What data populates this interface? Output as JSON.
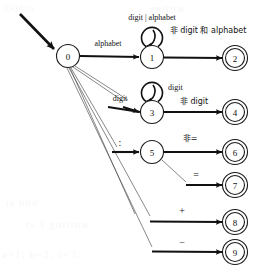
{
  "diagram": {
    "kind": "state-transition-diagram",
    "colors": {
      "stroke": "#111111",
      "thin_stroke": "#555555",
      "background": "#ffffff"
    },
    "start": {
      "label": "",
      "target_state": "0"
    },
    "states": [
      {
        "id": "s0",
        "label": "0",
        "cx": 68,
        "cy": 56,
        "r": 11.5,
        "accepting": false
      },
      {
        "id": "s1",
        "label": "1",
        "cx": 152,
        "cy": 57,
        "r": 11.5,
        "accepting": false
      },
      {
        "id": "s2",
        "label": "2",
        "cx": 235,
        "cy": 58,
        "r": 9.5,
        "accepting": true
      },
      {
        "id": "s3",
        "label": "3",
        "cx": 152,
        "cy": 112,
        "r": 11.5,
        "accepting": false
      },
      {
        "id": "s4",
        "label": "4",
        "cx": 235,
        "cy": 112,
        "r": 9.5,
        "accepting": true
      },
      {
        "id": "s5",
        "label": "5",
        "cx": 152,
        "cy": 152,
        "r": 11.5,
        "accepting": false
      },
      {
        "id": "s6",
        "label": "6",
        "cx": 235,
        "cy": 152,
        "r": 9.5,
        "accepting": true
      },
      {
        "id": "s7",
        "label": "7",
        "cx": 235,
        "cy": 185,
        "r": 9.5,
        "accepting": true
      },
      {
        "id": "s8",
        "label": "8",
        "cx": 235,
        "cy": 222,
        "r": 9.5,
        "accepting": true
      },
      {
        "id": "s9",
        "label": "9",
        "cx": 235,
        "cy": 252,
        "r": 9.5,
        "accepting": true
      }
    ],
    "transitions": [
      {
        "id": "t0_1",
        "from": "0",
        "to": "1",
        "label": "alphabet",
        "label_x": 108,
        "label_y": 46
      },
      {
        "id": "t1_1",
        "from": "1",
        "to": "1",
        "label": "digit | alphabet",
        "label_x": 152,
        "label_y": 20,
        "self_loop": true
      },
      {
        "id": "t1_2",
        "from": "1",
        "to": "2",
        "label": "非 digit 和 alphabet",
        "label_x": 208,
        "label_y": 33
      },
      {
        "id": "t0_3",
        "from": "0",
        "to": "3",
        "label": "digit",
        "label_x": 120,
        "label_y": 101
      },
      {
        "id": "t3_3",
        "from": "3",
        "to": "3",
        "label": "digit",
        "label_x": 168,
        "label_y": 90,
        "self_loop": true
      },
      {
        "id": "t3_4",
        "from": "3",
        "to": "4",
        "label": "非 digit",
        "label_x": 194,
        "label_y": 104
      },
      {
        "id": "t0_5",
        "from": "0",
        "to": "5",
        "label": ":",
        "label_x": 120,
        "label_y": 144
      },
      {
        "id": "t5_6",
        "from": "5",
        "to": "6",
        "label": "非=",
        "label_x": 190,
        "label_y": 140
      },
      {
        "id": "t5_7",
        "from": "5",
        "to": "7",
        "label": "=",
        "label_x": 195,
        "label_y": 176
      },
      {
        "id": "t0_8",
        "from": "0",
        "to": "8",
        "label": "+",
        "label_x": 182,
        "label_y": 212
      },
      {
        "id": "t0_9",
        "from": "0",
        "to": "9",
        "label": "−",
        "label_x": 182,
        "label_y": 244
      }
    ],
    "background_artifacts": [
      {
        "text": "dsjoin",
        "x": 4,
        "y": 2
      },
      {
        "text": "gnitirw",
        "x": 150,
        "y": 3
      },
      {
        "text": "is bnu",
        "x": 6,
        "y": 196
      },
      {
        "text": "ts 1 gnitinw",
        "x": 26,
        "y": 218
      },
      {
        "text": "a=1; b=2; c=3;",
        "x": 2,
        "y": 248
      }
    ]
  }
}
